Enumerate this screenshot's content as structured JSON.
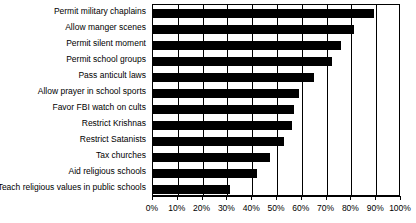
{
  "chart_data": {
    "type": "bar",
    "orientation": "horizontal",
    "title": "",
    "subtitle": "",
    "xlabel": "",
    "ylabel": "",
    "xlim": [
      0,
      100
    ],
    "xtick_labels": [
      "0%",
      "10%",
      "20%",
      "30%",
      "40%",
      "50%",
      "60%",
      "70%",
      "80%",
      "90%",
      "100%"
    ],
    "xticks": [
      0,
      10,
      20,
      30,
      40,
      50,
      60,
      70,
      80,
      90,
      100
    ],
    "grid": true,
    "grid_axis": "x",
    "legend": false,
    "legend_position": "none",
    "bar_color": "#000000",
    "background_color": "#ffffff",
    "axis_color": "#000000",
    "categories": [
      "Permit military chaplains",
      "Allow manger scenes",
      "Permit silent moment",
      "Permit school groups",
      "Pass anticult laws",
      "Allow prayer in school sports",
      "Favor FBI watch on cults",
      "Restrict Krishnas",
      "Restrict Satanists",
      "Tax churches",
      "Aid religious schools",
      "Teach religious values in public schools"
    ],
    "values": [
      89,
      81,
      76,
      72,
      65,
      59,
      57,
      56,
      53,
      47,
      42,
      31
    ],
    "series": [
      {
        "name": "Percent favoring",
        "values": [
          89,
          81,
          76,
          72,
          65,
          59,
          57,
          56,
          53,
          47,
          42,
          31
        ]
      }
    ]
  }
}
